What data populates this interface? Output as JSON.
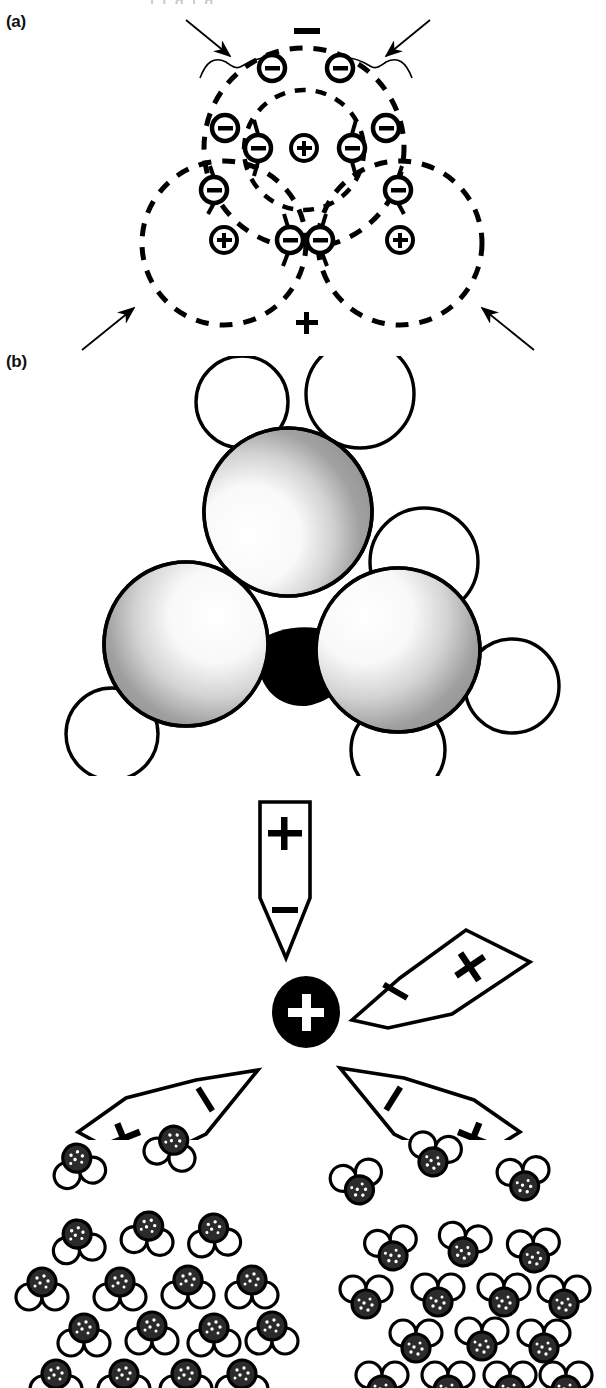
{
  "figure": {
    "width": 606,
    "height": 1388,
    "background": "#ffffff",
    "ink": "#000000",
    "top_crop_remnant": "i i g  i g"
  },
  "panels": [
    {
      "id": "a",
      "label": "(a)",
      "type": "lewis-shell-diagram",
      "description": "Overlapping dashed electron-shell circles with nuclei and electron pairs",
      "polarity_labels": {
        "top": "−",
        "bottom": "+"
      },
      "nuclei": [
        {
          "name": "central-nucleus",
          "sign": "+",
          "cx": 304,
          "cy": 148,
          "r": 13
        },
        {
          "name": "left-nucleus",
          "sign": "+",
          "cx": 224,
          "cy": 240,
          "r": 13
        },
        {
          "name": "right-nucleus",
          "sign": "+",
          "cx": 400,
          "cy": 240,
          "r": 13
        }
      ],
      "shells": [
        {
          "name": "inner-shell",
          "cx": 304,
          "cy": 150,
          "r": 62
        },
        {
          "name": "outer-shell",
          "cx": 304,
          "cy": 148,
          "r": 108
        },
        {
          "name": "left-shell",
          "cx": 224,
          "cy": 243,
          "r": 82
        },
        {
          "name": "right-shell",
          "cx": 400,
          "cy": 243,
          "r": 82
        }
      ],
      "electrons": [
        {
          "sign": "−",
          "cx": 272,
          "cy": 68,
          "r": 13
        },
        {
          "sign": "−",
          "cx": 340,
          "cy": 68,
          "r": 13
        },
        {
          "sign": "−",
          "cx": 225,
          "cy": 128,
          "r": 13
        },
        {
          "sign": "−",
          "cx": 386,
          "cy": 128,
          "r": 13
        },
        {
          "sign": "−",
          "cx": 258,
          "cy": 148,
          "r": 13
        },
        {
          "sign": "−",
          "cx": 352,
          "cy": 148,
          "r": 13
        },
        {
          "sign": "−",
          "cx": 214,
          "cy": 190,
          "r": 13
        },
        {
          "sign": "−",
          "cx": 398,
          "cy": 190,
          "r": 13
        },
        {
          "sign": "−",
          "cx": 290,
          "cy": 240,
          "r": 13
        },
        {
          "sign": "−",
          "cx": 320,
          "cy": 240,
          "r": 13
        }
      ],
      "annotation_arrows": [
        {
          "name": "arrow-top-left",
          "x1": 188,
          "y1": 22,
          "x2": 232,
          "y2": 58
        },
        {
          "name": "arrow-top-right",
          "x1": 428,
          "y1": 22,
          "x2": 384,
          "y2": 58
        },
        {
          "name": "arrow-bottom-left",
          "x1": 84,
          "y1": 348,
          "x2": 138,
          "y2": 306
        },
        {
          "name": "arrow-bottom-right",
          "x1": 530,
          "y1": 348,
          "x2": 476,
          "y2": 306
        }
      ],
      "braces": [
        {
          "name": "brace-left"
        },
        {
          "name": "brace-right"
        }
      ]
    },
    {
      "id": "b",
      "label": "(b)",
      "type": "space-filling-model",
      "description": "CPK space-filling model: three large stippled spheres with small white hydrogen caps around a dark central region",
      "large_spheres": [
        {
          "name": "sphere-top",
          "cx": 288,
          "cy": 510,
          "r": 82
        },
        {
          "name": "sphere-lower-left",
          "cx": 186,
          "cy": 640,
          "r": 80
        },
        {
          "name": "sphere-lower-right",
          "cx": 398,
          "cy": 648,
          "r": 80
        }
      ],
      "small_spheres": [
        {
          "name": "cap-top-left",
          "cx": 242,
          "cy": 400,
          "r": 44
        },
        {
          "name": "cap-top-right",
          "cx": 358,
          "cy": 392,
          "r": 52
        },
        {
          "name": "cap-left",
          "cx": 113,
          "cy": 728,
          "r": 44
        },
        {
          "name": "cap-right",
          "cx": 506,
          "cy": 680,
          "r": 45
        },
        {
          "name": "cap-bottom",
          "cx": 398,
          "cy": 742,
          "r": 45
        },
        {
          "name": "cap-mid-right",
          "cx": 420,
          "cy": 560,
          "r": 52
        }
      ]
    },
    {
      "id": "dipole-vectors",
      "type": "dipole-vector-diagram",
      "description": "Central positive ion surrounded by four oriented dipole wedges, negative ends facing the ion",
      "center_ion": {
        "name": "central-cation",
        "sign": "+",
        "cx": 306,
        "cy": 1012,
        "r": 33,
        "fill": "#000000",
        "sign_color": "#ffffff"
      },
      "dipoles": [
        {
          "name": "dipole-up",
          "plus": "+",
          "minus": "−",
          "orientation": "vertical-down"
        },
        {
          "name": "dipole-upper-right",
          "plus": "+",
          "minus": "−",
          "orientation": "diagonal-down-left"
        },
        {
          "name": "dipole-lower-left",
          "plus": "+",
          "minus": "−",
          "orientation": "diagonal-up-right"
        },
        {
          "name": "dipole-lower-right",
          "plus": "+",
          "minus": "−",
          "orientation": "diagonal-up-left"
        }
      ]
    },
    {
      "id": "electrode-orientation",
      "type": "electrode-dipole-orientation",
      "description": "Clusters of polar molecules oriented toward a negative electrode (left) and a positive electrode (right)",
      "left": {
        "name": "negative-electrode-group",
        "electrode_sign": "−",
        "electrode_sign_count": 6,
        "molecule_orientation": "dark-atom-up",
        "rows": [
          4,
          4,
          4,
          3,
          2
        ]
      },
      "right": {
        "name": "positive-electrode-group",
        "electrode_sign": "+",
        "electrode_sign_count": 6,
        "molecule_orientation": "dark-atom-down",
        "rows": [
          4,
          4,
          3,
          3,
          3
        ]
      }
    }
  ]
}
